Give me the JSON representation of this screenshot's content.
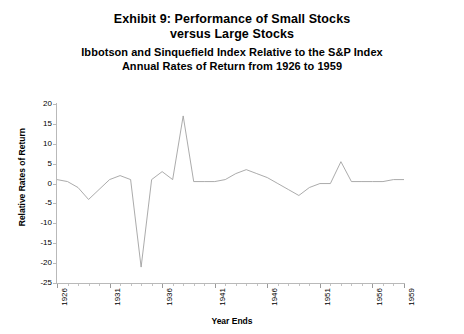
{
  "chart_data": {
    "type": "line",
    "title": "Exhibit 9: Performance of Small Stocks versus Large Stocks",
    "title_line1": "Exhibit 9: Performance of Small Stocks",
    "title_line2": "versus Large Stocks",
    "subtitle_line1": "Ibbotson and Sinquefield Index Relative to the S&P Index",
    "subtitle_line2": "Annual Rates of Return from 1926 to 1959",
    "xlabel": "Year Ends",
    "ylabel": "Relative Rates of Return",
    "xlim": [
      1926,
      1959
    ],
    "ylim": [
      -25,
      20
    ],
    "grid": false,
    "legend": "none",
    "yticks": [
      20,
      15,
      10,
      5,
      0,
      -5,
      -10,
      -15,
      -20,
      -25
    ],
    "ytick_labels": [
      "20",
      "15",
      "10",
      "5",
      "0",
      "-5",
      "-10",
      "-15",
      "-20",
      "-25"
    ],
    "xticks": [
      1926,
      1931,
      1936,
      1941,
      1946,
      1951,
      1956,
      1959
    ],
    "xtick_labels": [
      "1926",
      "1931",
      "1936",
      "1941",
      "1946",
      "1951",
      "1956",
      "1959"
    ],
    "x": [
      1926,
      1927,
      1928,
      1929,
      1930,
      1931,
      1932,
      1933,
      1934,
      1935,
      1936,
      1937,
      1938,
      1939,
      1940,
      1941,
      1942,
      1943,
      1944,
      1945,
      1946,
      1947,
      1948,
      1949,
      1950,
      1951,
      1952,
      1953,
      1954,
      1955,
      1956,
      1957,
      1958,
      1959
    ],
    "categories": [
      "1926",
      "1927",
      "1928",
      "1929",
      "1930",
      "1931",
      "1932",
      "1933",
      "1934",
      "1935",
      "1936",
      "1937",
      "1938",
      "1939",
      "1940",
      "1941",
      "1942",
      "1943",
      "1944",
      "1945",
      "1946",
      "1947",
      "1948",
      "1949",
      "1950",
      "1951",
      "1952",
      "1953",
      "1954",
      "1955",
      "1956",
      "1957",
      "1958",
      "1959"
    ],
    "values": [
      1.0,
      0.5,
      -1.0,
      -4.0,
      -1.5,
      1.0,
      2.0,
      1.0,
      -21.0,
      1.0,
      3.0,
      1.0,
      17.0,
      0.5,
      0.5,
      0.5,
      1.0,
      2.5,
      3.5,
      2.5,
      1.5,
      0.0,
      -1.5,
      -3.0,
      -1.0,
      0.0,
      0.0,
      5.5,
      0.5,
      0.5,
      0.5,
      0.5,
      1.0,
      1.0
    ],
    "series": [
      {
        "name": "Ibbotson and Sinquefield Index Relative to the S&P Index",
        "values": [
          1.0,
          0.5,
          -1.0,
          -4.0,
          -1.5,
          1.0,
          2.0,
          1.0,
          -21.0,
          1.0,
          3.0,
          1.0,
          17.0,
          0.5,
          0.5,
          0.5,
          1.0,
          2.5,
          3.5,
          2.5,
          1.5,
          0.0,
          -1.5,
          -3.0,
          -1.0,
          0.0,
          0.0,
          5.5,
          0.5,
          0.5,
          0.5,
          0.5,
          1.0,
          1.0
        ],
        "color": "#9c9c9c"
      }
    ]
  },
  "colors": {
    "line": "#9c9c9c",
    "axis": "#b9b9b9",
    "text": "#000000",
    "background": "#ffffff"
  }
}
